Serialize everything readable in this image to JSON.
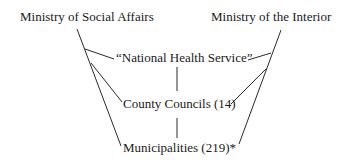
{
  "diagram": {
    "nodes": [
      {
        "id": "social_affairs",
        "label": "Ministry of Social Affairs"
      },
      {
        "id": "interior",
        "label": "Ministry of the Interior"
      },
      {
        "id": "nhs",
        "label": "“National Health Service”"
      },
      {
        "id": "county_councils",
        "label": "County Councils (14)"
      },
      {
        "id": "municipalities",
        "label": "Municipalities (219)*"
      }
    ],
    "edges": [
      {
        "from": "social_affairs",
        "to": "nhs"
      },
      {
        "from": "social_affairs",
        "to": "county_councils"
      },
      {
        "from": "social_affairs",
        "to": "municipalities"
      },
      {
        "from": "interior",
        "to": "nhs"
      },
      {
        "from": "interior",
        "to": "county_councils"
      },
      {
        "from": "interior",
        "to": "municipalities"
      },
      {
        "from": "nhs",
        "to": "county_councils"
      },
      {
        "from": "county_councils",
        "to": "municipalities"
      }
    ],
    "line_color": "#2a2a2a"
  }
}
